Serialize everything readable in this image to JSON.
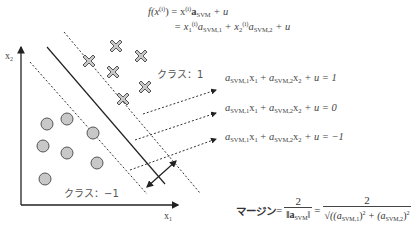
{
  "top_equation": {
    "line1_lhs": "f(x",
    "line1_sup": "(i)",
    "line1_rhs": ") = x",
    "line1_rhs_sup": "(i)",
    "line1_vec": "a",
    "line1_vec_sub": "SVM",
    "line1_tail": " + u",
    "line2_prefix": "= x",
    "line2_x1_sub": "1",
    "line2_sup": "(i)",
    "line2_a1": "a",
    "line2_a1_sub": "SVM,1",
    "line2_plus": " + x",
    "line2_x2_sub": "2",
    "line2_a2": "a",
    "line2_a2_sub": "SVM,2",
    "line2_tail": " + u"
  },
  "axes": {
    "x_label": "x",
    "x_label_sub": "1",
    "y_label": "x",
    "y_label_sub": "2"
  },
  "class_labels": {
    "positive": "クラス：1",
    "negative": "クラス：−1"
  },
  "hyperplane_equations": [
    {
      "a1": "a",
      "a1_sub": "SVM,1",
      "x1": "x",
      "x1_sub": "1",
      "plus": " + ",
      "a2": "a",
      "a2_sub": "SVM,2",
      "x2": "x",
      "x2_sub": "2",
      "tail": " + u = 1"
    },
    {
      "a1": "a",
      "a1_sub": "SVM,1",
      "x1": "x",
      "x1_sub": "1",
      "plus": " + ",
      "a2": "a",
      "a2_sub": "SVM,2",
      "x2": "x",
      "x2_sub": "2",
      "tail": " + u = 0"
    },
    {
      "a1": "a",
      "a1_sub": "SVM,1",
      "x1": "x",
      "x1_sub": "1",
      "plus": " + ",
      "a2": "a",
      "a2_sub": "SVM,2",
      "x2": "x",
      "x2_sub": "2",
      "tail": " + u = −1"
    }
  ],
  "margin_equation": {
    "label": "マージン",
    "eq1": " = ",
    "num1": "2",
    "den1_prefix": "‖a",
    "den1_sub": "SVM",
    "den1_suffix": "‖",
    "eq2": " = ",
    "num2": "2",
    "den2_a": "√((a",
    "den2_a_sub": "SVM,1",
    "den2_mid": ")",
    "den2_sq1": "2",
    "den2_plus": " + (a",
    "den2_b_sub": "SVM,2",
    "den2_end": ")",
    "den2_sq2": "2"
  },
  "points": {
    "class_pos_crosses": [
      [
        117,
        44
      ],
      [
        88,
        62
      ],
      [
        141,
        55
      ],
      [
        113,
        72
      ],
      [
        145,
        88
      ],
      [
        122,
        101
      ]
    ],
    "class_neg_circles": [
      [
        47,
        93
      ],
      [
        68,
        89
      ],
      [
        43,
        116
      ],
      [
        67,
        123
      ],
      [
        93,
        102
      ],
      [
        97,
        133
      ],
      [
        45,
        149
      ]
    ]
  },
  "colors": {
    "marker_fill": "#c8c8c8",
    "marker_stroke": "#555555",
    "line": "#222222",
    "text": "#444444"
  }
}
